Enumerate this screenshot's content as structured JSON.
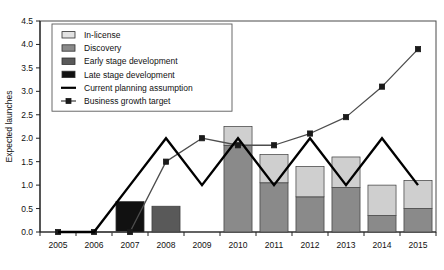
{
  "chart_data": {
    "type": "bar",
    "title": "",
    "xlabel": "",
    "ylabel": "Expected launches",
    "ylim": [
      0.0,
      4.5
    ],
    "ytick_step": 0.5,
    "grid": false,
    "legend_position": "top-left",
    "categories": [
      "2005",
      "2006",
      "2007",
      "2008",
      "2009",
      "2010",
      "2011",
      "2012",
      "2013",
      "2014",
      "2015"
    ],
    "yticks": [
      "0.0",
      "0.5",
      "1.0",
      "1.5",
      "2.0",
      "2.5",
      "3.0",
      "3.5",
      "4.0",
      "4.5"
    ],
    "series": [
      {
        "name": "Late stage development",
        "kind": "bar-segment",
        "color": "#111111",
        "values": [
          0,
          0,
          0.65,
          0,
          0,
          0,
          0,
          0,
          0,
          0,
          0
        ]
      },
      {
        "name": "Early stage development",
        "kind": "bar-segment",
        "color": "#595959",
        "values": [
          0,
          0,
          0,
          0.55,
          0,
          0,
          0,
          0,
          0,
          0,
          0
        ]
      },
      {
        "name": "Discovery",
        "kind": "bar-segment",
        "color": "#8a8a8a",
        "values": [
          0,
          0,
          0,
          0,
          0,
          1.85,
          1.05,
          0.75,
          0.95,
          0.35,
          0.5
        ]
      },
      {
        "name": "In-license",
        "kind": "bar-segment",
        "color": "#cfcfcf",
        "values": [
          0,
          0,
          0,
          0,
          0,
          0.4,
          0.6,
          0.65,
          0.65,
          0.65,
          0.6
        ]
      },
      {
        "name": "Current planning assumption",
        "kind": "line",
        "color": "#000000",
        "values": [
          0.0,
          0.0,
          1.0,
          2.0,
          1.0,
          2.0,
          1.0,
          2.0,
          1.0,
          2.0,
          1.0
        ]
      },
      {
        "name": "Business growth target",
        "kind": "line-marker",
        "color": "#4d4d4d",
        "marker": "square",
        "values": [
          0.0,
          0.0,
          0.0,
          1.5,
          2.0,
          1.85,
          1.85,
          2.1,
          2.45,
          3.1,
          3.9
        ]
      }
    ],
    "bar_totals": [
      0,
      0,
      0.65,
      0.55,
      0,
      2.25,
      1.65,
      1.4,
      1.6,
      1.0,
      1.1
    ],
    "legend": [
      {
        "label": "In-license",
        "swatch": "light-gray-fill",
        "color": "#e2e2e2",
        "type": "box"
      },
      {
        "label": "Discovery",
        "swatch": "mid-gray-fill",
        "color": "#8a8a8a",
        "type": "box"
      },
      {
        "label": "Early stage development",
        "swatch": "dark-gray-fill",
        "color": "#595959",
        "type": "box"
      },
      {
        "label": "Late stage development",
        "swatch": "black-fill",
        "color": "#111111",
        "type": "box"
      },
      {
        "label": "Current planning assumption",
        "swatch": "solid-line",
        "color": "#000000",
        "type": "line"
      },
      {
        "label": "Business growth target",
        "swatch": "line-with-square-marker",
        "color": "#4d4d4d",
        "type": "line-marker"
      }
    ]
  }
}
